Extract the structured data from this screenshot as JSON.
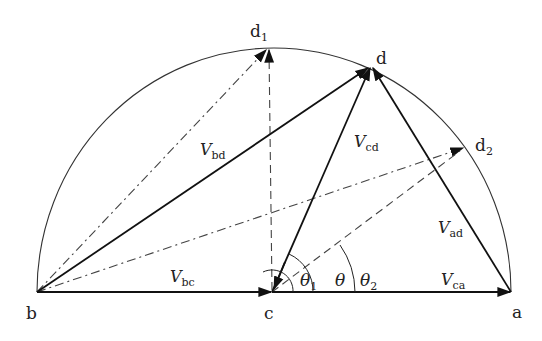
{
  "diagram": {
    "points": {
      "a": "a",
      "b": "b",
      "c": "c",
      "d": "d",
      "d1": "d",
      "d1_sub": "1",
      "d2": "d",
      "d2_sub": "2"
    },
    "vectors": {
      "bd": {
        "main": "V",
        "sub": "bd"
      },
      "cd": {
        "main": "V",
        "sub": "cd"
      },
      "ad": {
        "main": "V",
        "sub": "ad"
      },
      "bc": {
        "main": "V",
        "sub": "bc"
      },
      "ca": {
        "main": "V",
        "sub": "ca"
      }
    },
    "angles": {
      "theta1": {
        "main": "θ",
        "sub": "1"
      },
      "theta": {
        "main": "θ"
      },
      "theta2": {
        "main": "θ",
        "sub": "2"
      }
    },
    "colors": {
      "line": "#111111",
      "arc": "#333333",
      "dashed": "#444444"
    }
  }
}
